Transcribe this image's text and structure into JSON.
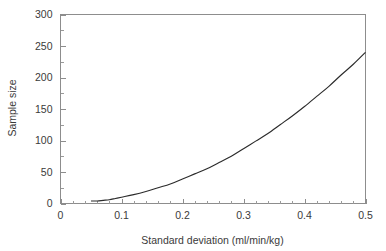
{
  "chart_data": {
    "type": "line",
    "title": "",
    "subtitle": "",
    "xlabel": "Standard deviation (ml/min/kg)",
    "ylabel": "Sample size",
    "xlim": [
      0,
      0.5
    ],
    "ylim": [
      0,
      300
    ],
    "grid": false,
    "legend": null,
    "x_ticks": [
      0,
      0.1,
      0.2,
      0.3,
      0.4,
      0.5
    ],
    "x_tick_labels": [
      "0",
      "0.1",
      "0.2",
      "0.3",
      "0.4",
      "0.5"
    ],
    "x_minor_tick_step": 0.02,
    "y_ticks": [
      0,
      50,
      100,
      150,
      200,
      250,
      300
    ],
    "y_tick_labels": [
      "0",
      "50",
      "100",
      "150",
      "200",
      "250",
      "300"
    ],
    "y_minor_tick_step": 25,
    "series": [
      {
        "name": "Required sample size",
        "relationship": "n proportional to standard deviation squared",
        "x": [
          0.05,
          0.06,
          0.07,
          0.08,
          0.09,
          0.1,
          0.12,
          0.14,
          0.16,
          0.18,
          0.2,
          0.22,
          0.24,
          0.26,
          0.28,
          0.3,
          0.32,
          0.34,
          0.36,
          0.38,
          0.4,
          0.42,
          0.44,
          0.46,
          0.48,
          0.5
        ],
        "values": [
          4,
          4,
          5,
          6,
          8,
          10,
          14,
          19,
          25,
          31,
          39,
          47,
          55,
          65,
          75,
          87,
          99,
          111,
          125,
          139,
          154,
          170,
          186,
          204,
          221,
          240
        ]
      }
    ],
    "annotations": [],
    "colors": {
      "curve": "#2b2b2b",
      "axis": "#8d8d8d",
      "text": "#3a3a3a",
      "background": "#ffffff"
    }
  }
}
